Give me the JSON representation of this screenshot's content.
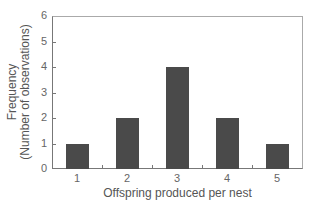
{
  "chart_data": {
    "type": "bar",
    "title": "",
    "xlabel": "Offspring produced per nest",
    "ylabel_line1": "Frequency",
    "ylabel_line2": "(Number of observations)",
    "categories": [
      "1",
      "2",
      "3",
      "4",
      "5"
    ],
    "values": [
      1,
      2,
      4,
      2,
      1
    ],
    "ylim": [
      0,
      6
    ],
    "yticks": [
      "0",
      "1",
      "2",
      "3",
      "4",
      "5",
      "6"
    ],
    "grid": false,
    "legend": null,
    "bar_color": "#4a4a4a"
  }
}
